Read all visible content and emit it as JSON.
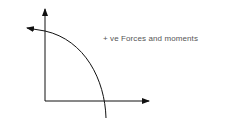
{
  "diagram": {
    "label": "+ ve Forces and moments",
    "colors": {
      "stroke": "#111111",
      "text": "#555555",
      "background": "#ffffff"
    },
    "elements": [
      {
        "name": "vertical-axis-arrow",
        "direction": "up"
      },
      {
        "name": "horizontal-axis-arrow",
        "direction": "right"
      },
      {
        "name": "curved-moment-arrow",
        "direction": "counter-clockwise"
      }
    ]
  }
}
